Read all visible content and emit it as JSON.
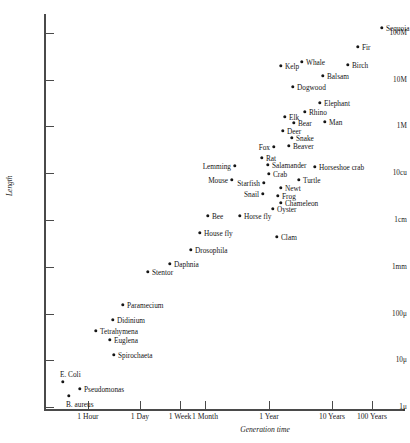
{
  "chart_data": {
    "type": "scatter",
    "title": "",
    "xlabel": "Generation time",
    "ylabel": "Length",
    "grid": false,
    "legend": null,
    "xticks": [
      {
        "label": "1 Hour",
        "px": 88
      },
      {
        "label": "1 Day",
        "px": 140
      },
      {
        "label": "1 Week",
        "px": 180
      },
      {
        "label": "1 Month",
        "px": 205
      },
      {
        "label": "1 Year",
        "px": 269
      },
      {
        "label": "10 Years",
        "px": 332
      },
      {
        "label": "100 Years",
        "px": 372
      }
    ],
    "yticks": [
      {
        "label": "100M",
        "px": 33
      },
      {
        "label": "10M",
        "px": 80
      },
      {
        "label": "1M",
        "px": 126
      },
      {
        "label": "10cu",
        "px": 173
      },
      {
        "label": "1cm",
        "px": 220
      },
      {
        "label": "1mm",
        "px": 267
      },
      {
        "label": "100μ",
        "px": 314
      },
      {
        "label": "10μ",
        "px": 360
      },
      {
        "label": "1μ",
        "px": 407
      }
    ],
    "points": [
      {
        "name": "Sequoia",
        "px": 382,
        "py": 28,
        "side": "right"
      },
      {
        "name": "Fir",
        "px": 358,
        "py": 47,
        "side": "right"
      },
      {
        "name": "Birch",
        "px": 348,
        "py": 65,
        "side": "right"
      },
      {
        "name": "Whale",
        "px": 302,
        "py": 62,
        "side": "right"
      },
      {
        "name": "Kelp",
        "px": 281,
        "py": 66,
        "side": "right"
      },
      {
        "name": "Balsam",
        "px": 323,
        "py": 76,
        "side": "right"
      },
      {
        "name": "Dogwood",
        "px": 293,
        "py": 87,
        "side": "right"
      },
      {
        "name": "Elephant",
        "px": 320,
        "py": 103,
        "side": "right"
      },
      {
        "name": "Rhino",
        "px": 305,
        "py": 112,
        "side": "right"
      },
      {
        "name": "Elk",
        "px": 285,
        "py": 117,
        "side": "right"
      },
      {
        "name": "Bear",
        "px": 294,
        "py": 123,
        "side": "right"
      },
      {
        "name": "Man",
        "px": 325,
        "py": 122,
        "side": "right"
      },
      {
        "name": "Deer",
        "px": 283,
        "py": 131,
        "side": "right"
      },
      {
        "name": "Snake",
        "px": 292,
        "py": 138,
        "side": "right"
      },
      {
        "name": "Beaver",
        "px": 289,
        "py": 146,
        "side": "right"
      },
      {
        "name": "Fox",
        "px": 274,
        "py": 147,
        "side": "left"
      },
      {
        "name": "Rat",
        "px": 262,
        "py": 158,
        "side": "right"
      },
      {
        "name": "Salamander",
        "px": 268,
        "py": 165,
        "side": "right"
      },
      {
        "name": "Crab",
        "px": 269,
        "py": 174,
        "side": "right"
      },
      {
        "name": "Horseshoe crab",
        "px": 315,
        "py": 167,
        "side": "right"
      },
      {
        "name": "Lemming",
        "px": 235,
        "py": 166,
        "side": "left"
      },
      {
        "name": "Mouse",
        "px": 232,
        "py": 180,
        "side": "left"
      },
      {
        "name": "Starfish",
        "px": 264,
        "py": 183,
        "side": "left"
      },
      {
        "name": "Turtle",
        "px": 299,
        "py": 180,
        "side": "right"
      },
      {
        "name": "Newt",
        "px": 281,
        "py": 188,
        "side": "right"
      },
      {
        "name": "Frog",
        "px": 278,
        "py": 196,
        "side": "right"
      },
      {
        "name": "Snail",
        "px": 263,
        "py": 194,
        "side": "left"
      },
      {
        "name": "Chameleon",
        "px": 281,
        "py": 203,
        "side": "right"
      },
      {
        "name": "Oyster",
        "px": 273,
        "py": 209,
        "side": "right"
      },
      {
        "name": "Bee",
        "px": 208,
        "py": 216,
        "side": "right"
      },
      {
        "name": "Horse fly",
        "px": 240,
        "py": 216,
        "side": "right"
      },
      {
        "name": "House fly",
        "px": 200,
        "py": 233,
        "side": "right"
      },
      {
        "name": "Clam",
        "px": 277,
        "py": 237,
        "side": "right"
      },
      {
        "name": "Drosophila",
        "px": 191,
        "py": 250,
        "side": "right"
      },
      {
        "name": "Daphnia",
        "px": 170,
        "py": 264,
        "side": "right"
      },
      {
        "name": "Stentor",
        "px": 148,
        "py": 272,
        "side": "right"
      },
      {
        "name": "Paramecium",
        "px": 123,
        "py": 305,
        "side": "right"
      },
      {
        "name": "Didinium",
        "px": 113,
        "py": 320,
        "side": "right"
      },
      {
        "name": "Tetrahymena",
        "px": 96,
        "py": 331,
        "side": "right"
      },
      {
        "name": "Euglena",
        "px": 110,
        "py": 340,
        "side": "right"
      },
      {
        "name": "Spirochaeta",
        "px": 114,
        "py": 355,
        "side": "right"
      },
      {
        "name": "E. Coli",
        "px": 63,
        "py": 382,
        "side": "above"
      },
      {
        "name": "Pseudomonas",
        "px": 80,
        "py": 389,
        "side": "right"
      },
      {
        "name": "B. aureus",
        "px": 69,
        "py": 396,
        "side": "below"
      }
    ]
  }
}
